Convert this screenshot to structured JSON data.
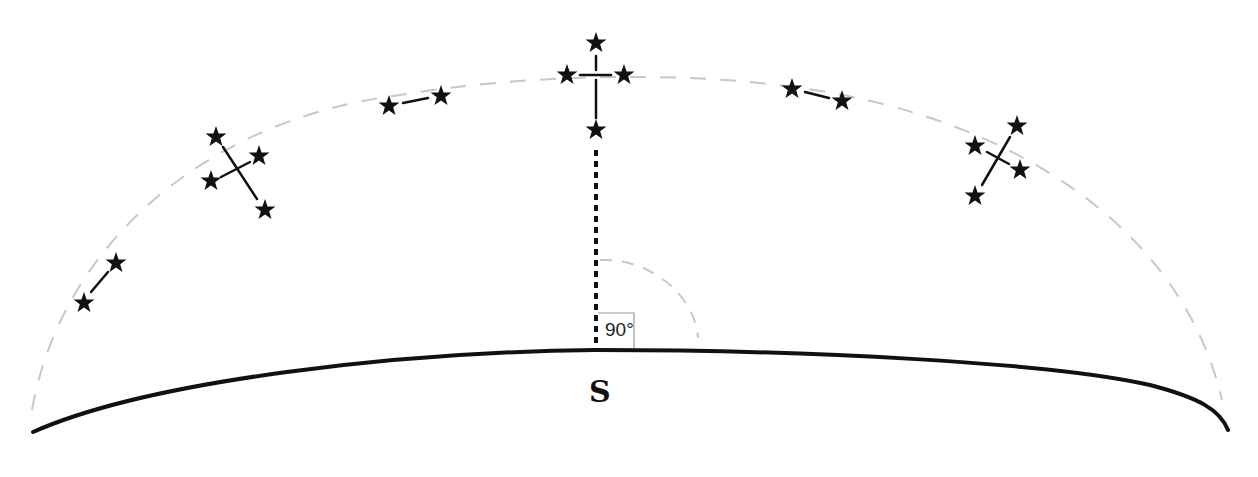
{
  "diagram": {
    "horizon_label": "S",
    "angle_label": "90°",
    "colors": {
      "stroke": "#111111",
      "dashed_arc": "#c8c8c8",
      "background": "#ffffff"
    },
    "constellations": [
      {
        "position": "far-left",
        "stars": [
          [
            84,
            303
          ],
          [
            116,
            263
          ]
        ]
      },
      {
        "position": "left",
        "stars": [
          [
            216,
            137
          ],
          [
            259,
            156
          ],
          [
            211,
            181
          ],
          [
            265,
            210
          ]
        ]
      },
      {
        "position": "upper-left",
        "stars": [
          [
            389,
            106
          ],
          [
            441,
            96
          ]
        ]
      },
      {
        "position": "top",
        "stars": [
          [
            596,
            43
          ],
          [
            567,
            75
          ],
          [
            624,
            75
          ],
          [
            596,
            130
          ]
        ]
      },
      {
        "position": "upper-right",
        "stars": [
          [
            792,
            89
          ],
          [
            842,
            101
          ]
        ]
      },
      {
        "position": "right",
        "stars": [
          [
            1017,
            126
          ],
          [
            975,
            146
          ],
          [
            1020,
            170
          ],
          [
            975,
            196
          ]
        ]
      }
    ]
  }
}
